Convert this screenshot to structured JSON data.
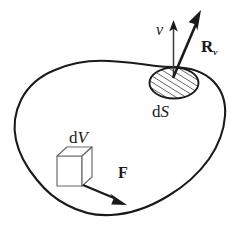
{
  "figure": {
    "background_color": "#ffffff",
    "stroke_color": "#1a1a1a",
    "width": 239,
    "height": 243,
    "labels": {
      "normal_vector": "ν",
      "reaction_vector_base": "R",
      "reaction_vector_subscript": "ν",
      "surface_element_prefix": "d",
      "surface_element_symbol": "S",
      "volume_element_prefix": "d",
      "volume_element_symbol": "V",
      "force_vector": "F"
    },
    "elements": {
      "body_outline": "closed irregular blob boundary",
      "surface_patch": "hatched ellipse on upper-right boundary",
      "volume_cube": "small wireframe cube inside body",
      "normal_arrow": "thin vertical arrow from surface patch",
      "reaction_arrow": "thick diagonal arrow from surface patch",
      "force_arrow": "thick diagonal arrow from cube"
    },
    "hatch": {
      "angle_deg": 60,
      "spacing_px": 5,
      "color": "#1a1a1a"
    }
  }
}
